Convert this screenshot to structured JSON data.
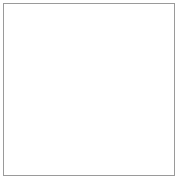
{
  "figure": {
    "title": "Wireframe globe graticule",
    "type": "sphere-wireframe",
    "background_color": "#ffffff",
    "frame": {
      "border_color": "#9a9a9a",
      "border_width_px": 1,
      "inset_px": 3
    }
  },
  "chart_data": {
    "type": "line",
    "title": "Wireframe globe graticule",
    "projection": "orthographic",
    "sphere": {
      "center_x": 86,
      "center_y": 86,
      "radius_x": 80,
      "radius_y": 84,
      "tilt_degrees": 0
    },
    "poles": {
      "north_pole_x": 86,
      "north_pole_y": 2,
      "south_pole_x": 86,
      "south_pole_y": 170
    },
    "meridians": {
      "count": 28,
      "spacing_degrees": 12.857,
      "color": "#8e8e8e",
      "line_width": 0.55
    },
    "parallels": {
      "count": 30,
      "spacing_degrees": 6,
      "color": "#8e8e8e",
      "line_width": 0.55
    },
    "emphasized_arcs": [
      {
        "name": "upper-dark-parallel",
        "latitude_degrees": 40,
        "color": "#3a3a3a",
        "line_width": 1.9
      },
      {
        "name": "lower-dark-parallel",
        "latitude_degrees": -46,
        "color": "#6e6e6e",
        "line_width": 1.4
      },
      {
        "name": "left-limb-arc",
        "longitude_degrees": -90,
        "color": "#474747",
        "line_width": 1.7
      },
      {
        "name": "right-limb-arc",
        "longitude_degrees": 90,
        "color": "#5a5a5a",
        "line_width": 1.6
      },
      {
        "name": "north-pole-cap",
        "latitude_degrees": 80,
        "color": "#5c5c5c",
        "line_width": 1.2
      }
    ],
    "grid": "on",
    "legend": "none",
    "xlabel": "",
    "ylabel": "",
    "xlim": [
      -1,
      1
    ],
    "ylim": [
      -1,
      1
    ]
  }
}
